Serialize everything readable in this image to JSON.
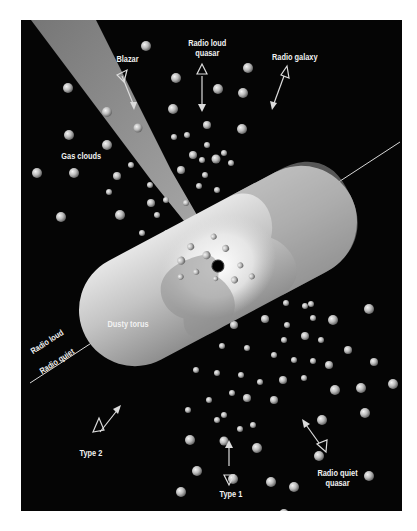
{
  "diagram": {
    "labels": {
      "blazar": "Blazar",
      "radio_loud_quasar_1": "Radio loud",
      "radio_loud_quasar_2": "quasar",
      "radio_galaxy": "Radio galaxy",
      "gas_clouds": "Gas clouds",
      "dusty_torus": "Dusty torus",
      "radio_loud": "Radio loud",
      "radio_quiet": "Radio quiet",
      "type2": "Type 2",
      "type1": "Type 1",
      "radio_quiet_quasar_1": "Radio quiet",
      "radio_quiet_quasar_2": "quasar"
    },
    "colors": {
      "background": "#050505",
      "frame": "#ffffff",
      "torus": "#bdbdbd",
      "jet": "#8a8a8a",
      "text": "#f2f2f2",
      "black_hole": "#000000"
    }
  }
}
